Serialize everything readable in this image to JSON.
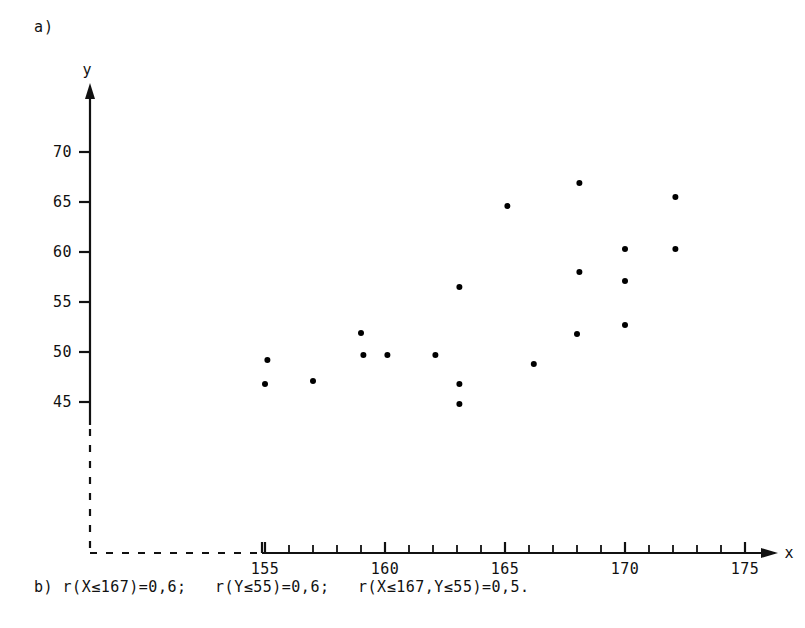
{
  "figure": {
    "panel_a_label": "a)",
    "panel_b_caption": "b) r(X≤167)=0,6;   r(Y≤55)=0,6;   r(X≤167,Y≤55)=0,5."
  },
  "chart_data": {
    "type": "scatter",
    "title": "",
    "xlabel": "x",
    "ylabel": "y",
    "xlim": [
      154.2,
      176.6
    ],
    "ylim": [
      43.0,
      72.5
    ],
    "xticks": [
      155,
      160,
      165,
      170,
      175
    ],
    "xtick_labels": [
      "155",
      "160",
      "165",
      "170",
      "175"
    ],
    "x_minor_tick_step": 1,
    "yticks": [
      45,
      50,
      55,
      60,
      65,
      70
    ],
    "ytick_labels": [
      "45",
      "50",
      "55",
      "60",
      "65",
      "70"
    ],
    "grid": false,
    "legend": null,
    "axis_break": {
      "y_axis_dashed_below": 43.0,
      "x_axis_dashed_left_of": 154.6,
      "note": "broken-axis elbow drawn with dashes near origin"
    },
    "marker": {
      "shape": "filled-circle",
      "color": "#000000",
      "size_px": 6
    },
    "points": [
      {
        "x": 155.1,
        "y": 49.2
      },
      {
        "x": 155.0,
        "y": 46.8
      },
      {
        "x": 157.0,
        "y": 47.1
      },
      {
        "x": 159.0,
        "y": 51.9
      },
      {
        "x": 159.1,
        "y": 49.7
      },
      {
        "x": 160.1,
        "y": 49.7
      },
      {
        "x": 162.1,
        "y": 49.7
      },
      {
        "x": 163.1,
        "y": 56.5
      },
      {
        "x": 163.1,
        "y": 46.8
      },
      {
        "x": 163.1,
        "y": 44.8
      },
      {
        "x": 165.1,
        "y": 64.6
      },
      {
        "x": 166.2,
        "y": 48.8
      },
      {
        "x": 168.1,
        "y": 66.9
      },
      {
        "x": 168.1,
        "y": 58.0
      },
      {
        "x": 168.0,
        "y": 51.8
      },
      {
        "x": 170.0,
        "y": 60.3
      },
      {
        "x": 170.0,
        "y": 57.1
      },
      {
        "x": 170.0,
        "y": 52.7
      },
      {
        "x": 172.1,
        "y": 65.5
      },
      {
        "x": 172.1,
        "y": 60.3
      }
    ]
  }
}
